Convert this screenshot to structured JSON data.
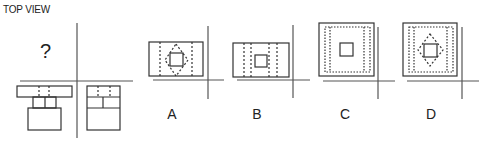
{
  "header": {
    "title": "TOP VIEW"
  },
  "question": {
    "unknown_view_mark": "?"
  },
  "given_views": [
    {
      "name": "front-view",
      "description": "T-shaped body: wide top slab with two hidden dashed lines, two stems, lower box"
    },
    {
      "name": "side-view",
      "description": "Rectangle split into three tiers with dashed hidden lines in top tier"
    }
  ],
  "options": [
    {
      "label": "A",
      "description": "Rectangle with two dashed verticals, dashed diamond around inner square"
    },
    {
      "label": "B",
      "description": "Rectangle with four dashed verticals, inner square"
    },
    {
      "label": "C",
      "description": "Square with dotted inner rectangle, inner square"
    },
    {
      "label": "D",
      "description": "Square with dotted inner rectangle, dashed diamond around inner square"
    }
  ],
  "colors": {
    "line": "#333333",
    "axis": "#555555",
    "text": "#222222"
  }
}
